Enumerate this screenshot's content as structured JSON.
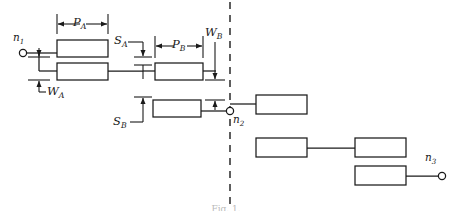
{
  "figure": {
    "kind": "interconnect-layout-diagram",
    "caption": "Fig. 1.",
    "stroke_color": "#1a1a1a",
    "background": "#ffffff"
  },
  "terminals": [
    {
      "id": "n1",
      "base": "n",
      "sub": "1",
      "x": 22,
      "y": 53,
      "label_x": 13,
      "label_y": 32
    },
    {
      "id": "n2",
      "base": "n",
      "sub": "2",
      "x": 230,
      "y": 111,
      "label_x": 233,
      "label_y": 116
    },
    {
      "id": "n3",
      "base": "n",
      "sub": "3",
      "x": 443,
      "y": 171,
      "label_x": 425,
      "label_y": 151
    }
  ],
  "dimensions": [
    {
      "id": "PA",
      "base": "P",
      "sub": "A",
      "orient": "horizontal",
      "label_x": 73,
      "label_y": 14
    },
    {
      "id": "WA",
      "base": "W",
      "sub": "A",
      "orient": "vertical",
      "label_x": 41,
      "label_y": 87
    },
    {
      "id": "SA",
      "base": "S",
      "sub": "A",
      "orient": "vertical",
      "label_x": 131,
      "label_y": 36
    },
    {
      "id": "PB",
      "base": "P",
      "sub": "B",
      "orient": "horizontal",
      "label_x": 176,
      "label_y": 36
    },
    {
      "id": "WB",
      "base": "W",
      "sub": "B",
      "orient": "vertical",
      "label_x": 206,
      "label_y": 28
    },
    {
      "id": "SB",
      "base": "S",
      "sub": "B",
      "orient": "vertical",
      "label_x": 116,
      "label_y": 119
    }
  ],
  "boundary": {
    "name": "cut-line",
    "x": 230,
    "style": "dashed"
  },
  "blocks": [
    {
      "id": "A1",
      "x": 57,
      "y": 40,
      "w": 51,
      "h": 17
    },
    {
      "id": "A2",
      "x": 57,
      "y": 63,
      "w": 51,
      "h": 17
    },
    {
      "id": "B1",
      "x": 155,
      "y": 63,
      "w": 48,
      "h": 17
    },
    {
      "id": "B2",
      "x": 153,
      "y": 100,
      "w": 48,
      "h": 17
    },
    {
      "id": "C1",
      "x": 256,
      "y": 95,
      "w": 51,
      "h": 19
    },
    {
      "id": "C2",
      "x": 256,
      "y": 138,
      "w": 51,
      "h": 19
    },
    {
      "id": "C3",
      "x": 355,
      "y": 138,
      "w": 51,
      "h": 19
    },
    {
      "id": "C4",
      "x": 355,
      "y": 166,
      "w": 51,
      "h": 19
    }
  ]
}
